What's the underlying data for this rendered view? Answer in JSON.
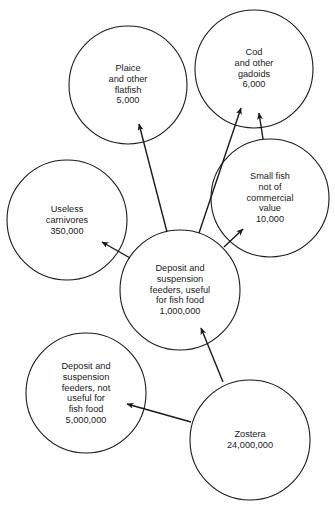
{
  "diagram": {
    "type": "food-web",
    "stroke_color": "#1a1a1a",
    "background": "#ffffff",
    "nodes": [
      {
        "id": "plaice",
        "lines": [
          "Plaice",
          "and other",
          "flatfish",
          "5,000"
        ],
        "cx": 128,
        "cy": 85,
        "r": 59
      },
      {
        "id": "cod",
        "lines": [
          "Cod",
          "and other",
          "gadoids",
          "6,000"
        ],
        "cx": 254,
        "cy": 69,
        "r": 59
      },
      {
        "id": "small-fish",
        "lines": [
          "Small fish",
          "not of",
          "commercial",
          "value",
          "10,000"
        ],
        "cx": 270,
        "cy": 198,
        "r": 59
      },
      {
        "id": "useless-carnivores",
        "lines": [
          "Useless",
          "carnivores",
          "350,000"
        ],
        "cx": 67,
        "cy": 220,
        "r": 60
      },
      {
        "id": "feeders-useful",
        "lines": [
          "Deposit and",
          "suspension",
          "feeders, useful",
          "for fish food",
          "1,000,000"
        ],
        "cx": 180,
        "cy": 290,
        "r": 60
      },
      {
        "id": "feeders-not-useful",
        "lines": [
          "Deposit and",
          "suspension",
          "feeders, not",
          "useful for",
          "fish food",
          "5,000,000"
        ],
        "cx": 86,
        "cy": 393,
        "r": 60
      },
      {
        "id": "zostera",
        "lines": [
          "Zostera",
          "24,000,000"
        ],
        "cx": 250,
        "cy": 440,
        "r": 60
      }
    ],
    "edges": [
      {
        "from": "feeders-useful",
        "to": "plaice",
        "x1": 167,
        "y1": 232,
        "x2": 139,
        "y2": 124
      },
      {
        "from": "feeders-useful",
        "to": "cod",
        "x1": 199,
        "y1": 233,
        "x2": 241,
        "y2": 108
      },
      {
        "from": "feeders-useful",
        "to": "small-fish",
        "x1": 224,
        "y1": 247,
        "x2": 243,
        "y2": 229
      },
      {
        "from": "feeders-useful",
        "to": "useless-carnivores",
        "x1": 130,
        "y1": 258,
        "x2": 102,
        "y2": 242
      },
      {
        "from": "small-fish",
        "to": "cod",
        "x1": 263,
        "y1": 139,
        "x2": 259,
        "y2": 113
      },
      {
        "from": "zostera",
        "to": "feeders-useful",
        "x1": 223,
        "y1": 382,
        "x2": 201,
        "y2": 328
      },
      {
        "from": "zostera",
        "to": "feeders-not-useful",
        "x1": 191,
        "y1": 422,
        "x2": 127,
        "y2": 404
      }
    ]
  }
}
